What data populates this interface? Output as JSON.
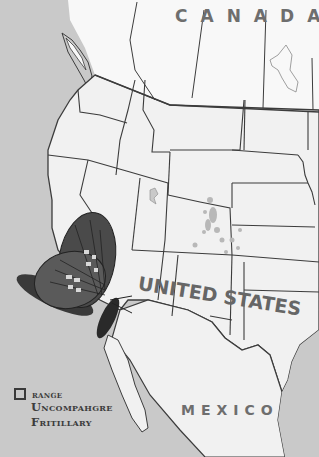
{
  "map": {
    "type": "species range map",
    "colors": {
      "ocean": "#c9c9c9",
      "land": "#f1f1f1",
      "canada_land": "#f8f8f8",
      "borders": "#3c3c3c",
      "range_patches": "#b8b8b8",
      "label_text": "#6e6e6e"
    },
    "labels": {
      "canada": "CANADA",
      "united_states": "UNITED STATES",
      "mexico": "MEXICO"
    }
  },
  "legend": {
    "swatch_label": "range",
    "species_line1": "Uncompahgre",
    "species_line2": "Fritillary"
  },
  "illustration": {
    "subject": "butterfly",
    "description": "Uncompahgre Fritillary butterfly illustration over the California coast"
  }
}
